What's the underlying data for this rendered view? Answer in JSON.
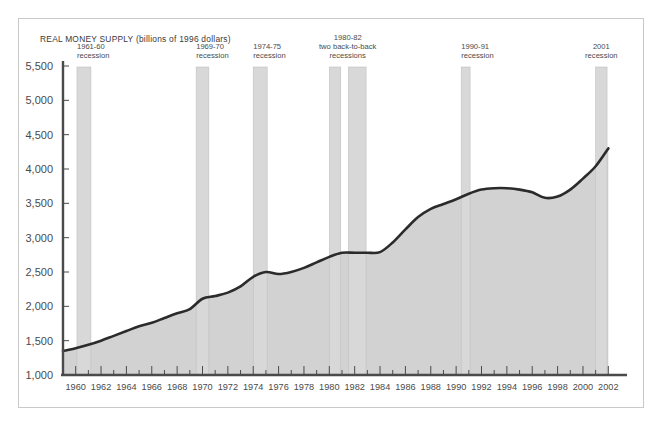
{
  "figure": {
    "title": "REAL MONEY SUPPLY (billions of 1996 dollars)",
    "frame_color": "#c9c9c9",
    "background": "#ffffff"
  },
  "chart_data": {
    "type": "area",
    "title": "REAL MONEY SUPPLY (billions of 1996 dollars)",
    "xlabel": "",
    "ylabel": "",
    "grid": false,
    "legend": "none",
    "xlim": [
      1959,
      2003
    ],
    "ylim": [
      1000,
      5500
    ],
    "ytick_labels": [
      "5,500",
      "5,000",
      "4,500",
      "4,000",
      "3,500",
      "3,000",
      "2,500",
      "2,000",
      "1,500",
      "1,000"
    ],
    "ytick_values": [
      5500,
      5000,
      4500,
      4000,
      3500,
      3000,
      2500,
      2000,
      1500,
      1000
    ],
    "xtick_labels": [
      "1960",
      "1962",
      "1964",
      "1966",
      "1968",
      "1970",
      "1972",
      "1974",
      "1976",
      "1978",
      "1980",
      "1982",
      "1984",
      "1986",
      "1988",
      "1990",
      "1992",
      "1994",
      "1996",
      "1998",
      "2000",
      "2002"
    ],
    "xtick_values": [
      1960,
      1962,
      1964,
      1966,
      1968,
      1970,
      1972,
      1974,
      1976,
      1978,
      1980,
      1982,
      1984,
      1986,
      1988,
      1990,
      1992,
      1994,
      1996,
      1998,
      2000,
      2002
    ],
    "series_name": "Real money supply",
    "line_color": "#2b2b2b",
    "area_color": "#d2d2d2",
    "x": [
      1959,
      1960,
      1961,
      1962,
      1963,
      1964,
      1965,
      1966,
      1967,
      1968,
      1969,
      1970,
      1971,
      1972,
      1973,
      1974,
      1975,
      1976,
      1977,
      1978,
      1979,
      1980,
      1981,
      1982,
      1983,
      1984,
      1985,
      1986,
      1987,
      1988,
      1989,
      1990,
      1991,
      1992,
      1993,
      1994,
      1995,
      1996,
      1997,
      1998,
      1999,
      2000,
      2001,
      2002
    ],
    "y": [
      1350,
      1390,
      1440,
      1500,
      1570,
      1640,
      1710,
      1760,
      1830,
      1900,
      1960,
      2110,
      2150,
      2200,
      2290,
      2430,
      2500,
      2470,
      2500,
      2560,
      2640,
      2720,
      2780,
      2780,
      2780,
      2790,
      2930,
      3120,
      3300,
      3420,
      3490,
      3560,
      3640,
      3700,
      3720,
      3720,
      3700,
      3660,
      3580,
      3600,
      3700,
      3860,
      4040,
      4300,
      4550,
      4750,
      5150
    ],
    "annotations": [
      {
        "label_line1": "1961-60",
        "label_line2": "recession",
        "x_start": 1960.1,
        "x_end": 1961.2,
        "kind": "recession-band"
      },
      {
        "label_line1": "1969-70",
        "label_line2": "recession",
        "x_start": 1969.5,
        "x_end": 1970.5,
        "kind": "recession-band"
      },
      {
        "label_line1": "1974-75",
        "label_line2": "recession",
        "x_start": 1974.0,
        "x_end": 1975.1,
        "kind": "recession-band"
      },
      {
        "label_line1": "1980-82",
        "label_line2": "two back-to-back",
        "label_line3": "recessions",
        "x_start": 1980.0,
        "x_end": 1980.9,
        "x2_start": 1981.5,
        "x2_end": 1982.9,
        "kind": "recession-band-double"
      },
      {
        "label_line1": "1990-91",
        "label_line2": "recession",
        "x_start": 1990.4,
        "x_end": 1991.1,
        "kind": "recession-band"
      },
      {
        "label_line1": "2001",
        "label_line2": "recession",
        "x_start": 2001.0,
        "x_end": 2001.9,
        "kind": "recession-band"
      }
    ]
  },
  "annotation_text": {
    "a0_l1": "1961-60",
    "a0_l2": "recession",
    "a1_l1": "1969-70",
    "a1_l2": "recession",
    "a2_l1": "1974-75",
    "a2_l2": "recession",
    "a3_l1": "1980-82",
    "a3_l2": "two back-to-back",
    "a3_l3": "recessions",
    "a4_l1": "1990-91",
    "a4_l2": "recession",
    "a5_l1": "2001",
    "a5_l2": "recession"
  },
  "y_axis": {
    "t0": "5,500",
    "t1": "5,000",
    "t2": "4,500",
    "t3": "4,000",
    "t4": "3,500",
    "t5": "3,000",
    "t6": "2,500",
    "t7": "2,000",
    "t8": "1,500",
    "t9": "1,000"
  },
  "x_axis": {
    "t0": "1960",
    "t1": "1962",
    "t2": "1964",
    "t3": "1966",
    "t4": "1968",
    "t5": "1970",
    "t6": "1972",
    "t7": "1974",
    "t8": "1976",
    "t9": "1978",
    "t10": "1980",
    "t11": "1982",
    "t12": "1984",
    "t13": "1986",
    "t14": "1988",
    "t15": "1990",
    "t16": "1992",
    "t17": "1994",
    "t18": "1996",
    "t19": "1998",
    "t20": "2000",
    "t21": "2002"
  }
}
